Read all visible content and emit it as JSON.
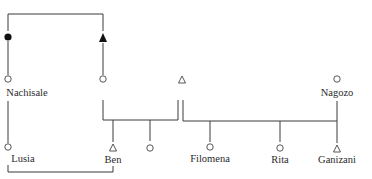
{
  "diagram": {
    "type": "kinship-chart",
    "legend_symbols": {
      "open_circle": "female",
      "open_triangle": "male",
      "filled_circle": "deceased female",
      "filled_triangle": "deceased male"
    },
    "colors": {
      "line": "#3a3a3a",
      "text": "#2a2a2a",
      "background": "#ffffff"
    },
    "nodes": [
      {
        "id": "n1",
        "symbol": "filled-circle",
        "label": ""
      },
      {
        "id": "n2",
        "symbol": "filled-triangle",
        "label": ""
      },
      {
        "id": "n3",
        "symbol": "open-circle",
        "label": "Nachisale"
      },
      {
        "id": "n4",
        "symbol": "open-circle",
        "label": ""
      },
      {
        "id": "n5",
        "symbol": "open-triangle",
        "label": ""
      },
      {
        "id": "n6",
        "symbol": "open-circle",
        "label": "Nagozo"
      },
      {
        "id": "n7",
        "symbol": "open-circle",
        "label": "Lusia"
      },
      {
        "id": "n8",
        "symbol": "open-triangle",
        "label": "Ben"
      },
      {
        "id": "n9",
        "symbol": "open-circle",
        "label": ""
      },
      {
        "id": "n10",
        "symbol": "open-circle",
        "label": "Filomena"
      },
      {
        "id": "n11",
        "symbol": "open-circle",
        "label": "Rita"
      },
      {
        "id": "n12",
        "symbol": "open-triangle",
        "label": "Ganizani"
      }
    ],
    "labels": {
      "nachisale": "Nachisale",
      "nagozo": "Nagozo",
      "lusia": "Lusia",
      "ben": "Ben",
      "filomena": "Filomena",
      "rita": "Rita",
      "ganizani": "Ganizani"
    }
  }
}
